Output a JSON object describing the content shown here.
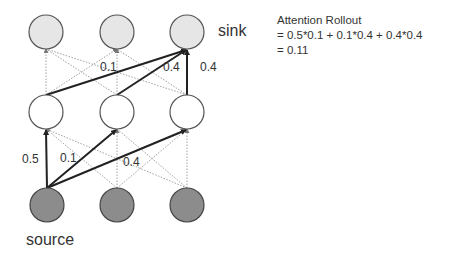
{
  "diagram": {
    "labels": {
      "sink": "sink",
      "source": "source"
    },
    "nodes": {
      "top": [
        {
          "x": 46,
          "y": 32
        },
        {
          "x": 117,
          "y": 32
        },
        {
          "x": 187,
          "y": 32
        }
      ],
      "middle": [
        {
          "x": 46,
          "y": 112
        },
        {
          "x": 117,
          "y": 112
        },
        {
          "x": 187,
          "y": 112
        }
      ],
      "bottom": [
        {
          "x": 47,
          "y": 205
        },
        {
          "x": 117,
          "y": 205
        },
        {
          "x": 187,
          "y": 205
        }
      ],
      "radius": 17,
      "colors": {
        "top_fill": "#e6e6e6",
        "middle_fill": "#ffffff",
        "bottom_fill": "#8c8c8c",
        "stroke": "#555555"
      }
    },
    "edge_labels": {
      "upper_a": "0.1",
      "upper_b": "0.4",
      "upper_c": "0.4",
      "lower_a": "0.5",
      "lower_b": "0.1",
      "lower_c": "0.4"
    }
  },
  "note": {
    "title": "Attention Rollout",
    "line1": "= 0.5*0.1 + 0.1*0.4 + 0.4*0.4",
    "line2": "= 0.11"
  }
}
